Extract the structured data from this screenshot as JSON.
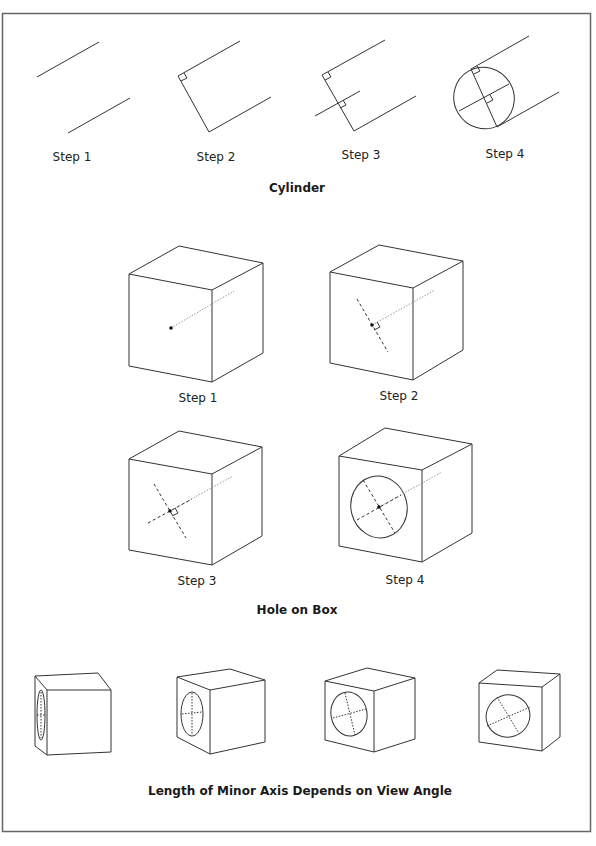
{
  "cylinder": {
    "title": "Cylinder",
    "steps": [
      {
        "label": "Step 1"
      },
      {
        "label": "Step 2"
      },
      {
        "label": "Step 3"
      },
      {
        "label": "Step 4"
      }
    ]
  },
  "hole_on_box": {
    "title": "Hole on Box",
    "steps": [
      {
        "label": "Step 1"
      },
      {
        "label": "Step 2"
      },
      {
        "label": "Step 3"
      },
      {
        "label": "Step 4"
      }
    ]
  },
  "view_angle": {
    "title": "Length of Minor Axis Depends on View Angle",
    "cube_count": 4
  },
  "colors": {
    "line": "#333333",
    "frame": "#666666",
    "dotted": "#999999"
  }
}
